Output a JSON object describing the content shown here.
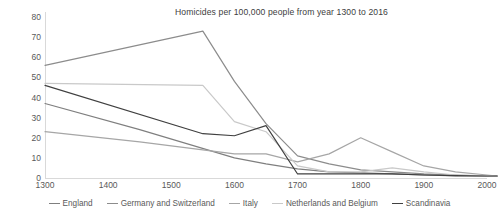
{
  "chart_data": {
    "type": "line",
    "title": "Homicides per 100,000 people from year 1300 to 2016",
    "xlabel": "",
    "ylabel": "",
    "xlim": [
      1300,
      2000
    ],
    "ylim": [
      0,
      80
    ],
    "grid": false,
    "legend_position": "bottom",
    "x_ticks": [
      "1300",
      "1400",
      "1500",
      "1600",
      "1700",
      "1800",
      "1900",
      "2000"
    ],
    "y_ticks": [
      "0",
      "10",
      "20",
      "30",
      "40",
      "50",
      "60",
      "70",
      "80"
    ],
    "series": [
      {
        "name": "England",
        "color": "#7f7f7f",
        "x": [
          1300,
          1450,
          1600,
          1650,
          1700,
          1750,
          1800,
          1850,
          1900,
          1950,
          2000,
          2016
        ],
        "values": [
          37,
          24,
          10,
          7,
          4.5,
          3,
          2.5,
          2,
          1.6,
          1.1,
          1,
          1
        ]
      },
      {
        "name": "Germany and Switzerland",
        "color": "#8c8c8c",
        "x": [
          1300,
          1550,
          1600,
          1650,
          1700,
          1750,
          1800,
          1850,
          1900,
          1950,
          2000,
          2016
        ],
        "values": [
          56,
          73,
          48,
          27,
          11,
          7,
          4,
          3,
          2,
          1.4,
          1,
          1
        ]
      },
      {
        "name": "Italy",
        "color": "#a6a6a6",
        "x": [
          1300,
          1450,
          1550,
          1600,
          1650,
          1700,
          1750,
          1800,
          1850,
          1900,
          1950,
          2000,
          2016
        ],
        "values": [
          23,
          18,
          14,
          12,
          12,
          8,
          12,
          20,
          13,
          6,
          3,
          1.5,
          1
        ]
      },
      {
        "name": "Netherlands and Belgium",
        "color": "#c9c9c9",
        "x": [
          1300,
          1550,
          1600,
          1650,
          1700,
          1750,
          1800,
          1850,
          1900,
          1950,
          2000,
          2016
        ],
        "values": [
          47,
          46,
          28,
          23,
          6,
          3,
          3,
          5,
          3,
          1.5,
          1.2,
          1
        ]
      },
      {
        "name": "Scandinavia",
        "color": "#404040",
        "x": [
          1300,
          1550,
          1600,
          1650,
          1700,
          1750,
          1800,
          1850,
          1900,
          1950,
          2000,
          2016
        ],
        "values": [
          46,
          22,
          21,
          26,
          2,
          2,
          2,
          2,
          1.5,
          1.2,
          1,
          1
        ]
      }
    ]
  },
  "legend": {
    "items": [
      {
        "label": "England"
      },
      {
        "label": "Germany and Switzerland"
      },
      {
        "label": "Italy"
      },
      {
        "label": "Netherlands and Belgium"
      },
      {
        "label": "Scandinavia"
      }
    ]
  }
}
